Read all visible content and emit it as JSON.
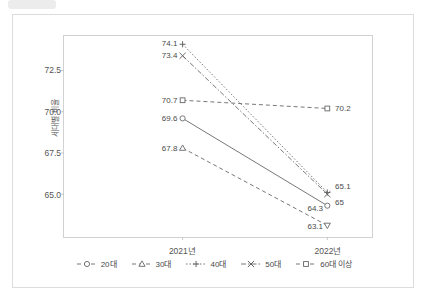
{
  "figure": {
    "badge_label": "",
    "y_axis_title": "세대별 비율"
  },
  "chart_data": {
    "type": "line",
    "title": "",
    "subtitle": "",
    "xlabel": "",
    "ylabel": "세대별 비율",
    "categories": [
      "2021년",
      "2022년"
    ],
    "x_tick_labels": [
      "2021년",
      "2022년"
    ],
    "y_tick_labels": [
      "65.0",
      "67.5",
      "70.0",
      "72.5"
    ],
    "y_ticks": [
      65.0,
      67.5,
      70.0,
      72.5
    ],
    "ylim": [
      62.4,
      74.6
    ],
    "grid": false,
    "legend_position": "bottom",
    "series": [
      {
        "name": "20대",
        "marker": "circle",
        "line_style": "solid",
        "color": "#666666",
        "values": [
          69.6,
          64.3
        ],
        "labels": [
          "69.6",
          "64.3"
        ],
        "label_side": [
          "left",
          "left"
        ]
      },
      {
        "name": "30대",
        "marker": "triangle",
        "line_style": "dashed",
        "color": "#666666",
        "values": [
          67.8,
          63.1
        ],
        "labels": [
          "67.8",
          "63.1"
        ],
        "label_side": [
          "left",
          "left"
        ]
      },
      {
        "name": "40대",
        "marker": "plus",
        "line_style": "dotted",
        "color": "#666666",
        "values": [
          74.1,
          65.1
        ],
        "labels": [
          "74.1",
          "65.1"
        ],
        "label_side": [
          "left",
          "right"
        ]
      },
      {
        "name": "50대",
        "marker": "cross",
        "line_style": "dashdot",
        "color": "#666666",
        "values": [
          73.4,
          65.0
        ],
        "labels": [
          "73.4",
          "65"
        ],
        "label_side": [
          "left",
          "right"
        ]
      },
      {
        "name": "60대 이상",
        "marker": "square",
        "line_style": "dashed",
        "color": "#666666",
        "values": [
          70.7,
          70.2
        ],
        "labels": [
          "70.7",
          "70.2"
        ],
        "label_side": [
          "left",
          "right"
        ]
      }
    ],
    "legend": [
      {
        "label": "20대",
        "marker": "circle",
        "line_style": "solid"
      },
      {
        "label": "30대",
        "marker": "triangle",
        "line_style": "solid"
      },
      {
        "label": "40대",
        "marker": "plus",
        "line_style": "dotted"
      },
      {
        "label": "50대",
        "marker": "cross",
        "line_style": "dashdot"
      },
      {
        "label": "60대 이상",
        "marker": "square",
        "line_style": "dashed"
      }
    ]
  }
}
